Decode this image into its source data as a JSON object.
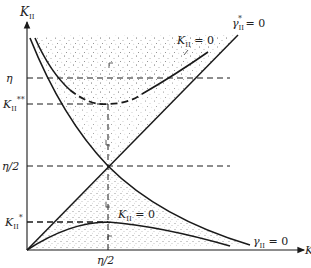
{
  "diagram": {
    "axes": {
      "y_label": "K",
      "y_label_sub": "II",
      "x_label": "K",
      "x_tick_label": "η/2"
    },
    "y_ticks": [
      {
        "id": "eta",
        "label": "η"
      },
      {
        "id": "kss",
        "label": "K",
        "sub": "II",
        "sup": "**"
      },
      {
        "id": "eta2",
        "label": "η/2"
      },
      {
        "id": "ks",
        "label": "K",
        "sub": "II",
        "sup": "*"
      }
    ],
    "curve_labels": {
      "upper_k_zero": {
        "main": "K",
        "sub": "II",
        "rest": " = 0"
      },
      "gamma_star_zero": {
        "main": "γ",
        "sub": "II",
        "sup": "*",
        "rest": " = 0"
      },
      "lower_k_zero": {
        "main": "K",
        "sub": "II",
        "rest": " = 0"
      },
      "gamma_zero": {
        "main": "γ",
        "sub": "II",
        "rest": " = 0"
      }
    },
    "colors": {
      "line": "#1a1a1a",
      "stipple": "#9a9a9a"
    }
  }
}
